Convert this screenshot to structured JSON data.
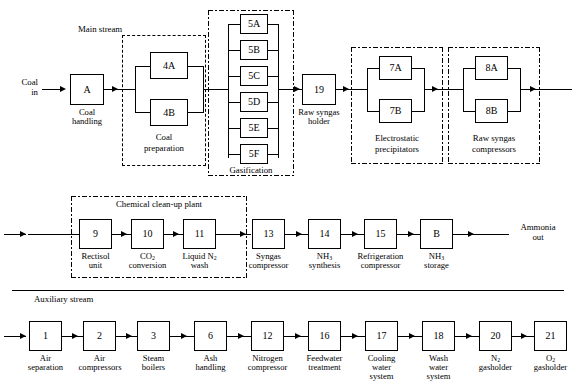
{
  "diagram": {
    "type": "process-flow-diagram",
    "stream_labels": {
      "main_stream": "Main stream",
      "auxiliary_stream": "Auxiliary stream"
    },
    "terminals": {
      "coal_in": "Coal\nin",
      "coal_in_line1": "Coal",
      "coal_in_line2": "in",
      "ammonia_out_line1": "Ammonia",
      "ammonia_out_line2": "out"
    },
    "groups": [
      {
        "id": "coal-preparation",
        "label": "Coal\npreparation",
        "label_line1": "Coal",
        "label_line2": "preparation",
        "style": "dashed"
      },
      {
        "id": "gasification",
        "label": "Gasification",
        "label_line1": "Gasification",
        "label_line2": "",
        "style": "dashdot"
      },
      {
        "id": "electrostatic-precipitators",
        "label": "Electrostatic\nprecipitators",
        "label_line1": "Electrostatic",
        "label_line2": "precipitators",
        "style": "dashdot"
      },
      {
        "id": "raw-syngas-compressors",
        "label": "Raw syngas\ncompressors",
        "label_line1": "Raw syngas",
        "label_line2": "compressors",
        "style": "dashdot"
      },
      {
        "id": "chemical-cleanup-plant",
        "label": "Chemical clean-up plant",
        "label_line1": "Chemical clean-up plant",
        "label_line2": "",
        "style": "dashdot"
      }
    ],
    "main_row": {
      "units": [
        {
          "tag": "A",
          "label_line1": "Coal",
          "label_line2": "handling"
        },
        {
          "tag": "4A",
          "label_line1": "",
          "label_line2": ""
        },
        {
          "tag": "4B",
          "label_line1": "",
          "label_line2": ""
        },
        {
          "tag": "5A",
          "label_line1": "",
          "label_line2": ""
        },
        {
          "tag": "5B",
          "label_line1": "",
          "label_line2": ""
        },
        {
          "tag": "5C",
          "label_line1": "",
          "label_line2": ""
        },
        {
          "tag": "5D",
          "label_line1": "",
          "label_line2": ""
        },
        {
          "tag": "5E",
          "label_line1": "",
          "label_line2": ""
        },
        {
          "tag": "5F",
          "label_line1": "",
          "label_line2": ""
        },
        {
          "tag": "19",
          "label_line1": "Raw syngas",
          "label_line2": "holder"
        },
        {
          "tag": "7A",
          "label_line1": "",
          "label_line2": ""
        },
        {
          "tag": "7B",
          "label_line1": "",
          "label_line2": ""
        },
        {
          "tag": "8A",
          "label_line1": "",
          "label_line2": ""
        },
        {
          "tag": "8B",
          "label_line1": "",
          "label_line2": ""
        }
      ]
    },
    "middle_row": {
      "units": [
        {
          "tag": "9",
          "label_line1": "Rectisol",
          "label_line2": "unit"
        },
        {
          "tag": "10",
          "label_line1": "CO2",
          "label_line2": "conversion",
          "sub": "2",
          "base": "CO"
        },
        {
          "tag": "11",
          "label_line1": "Liquid N2",
          "label_line2": "wash",
          "sub": "2",
          "base": "Liquid N"
        },
        {
          "tag": "13",
          "label_line1": "Syngas",
          "label_line2": "compressor"
        },
        {
          "tag": "14",
          "label_line1": "NH3",
          "label_line2": "synthesis",
          "sub": "3",
          "base": "NH"
        },
        {
          "tag": "15",
          "label_line1": "Refrigeration",
          "label_line2": "compressor"
        },
        {
          "tag": "B",
          "label_line1": "NH3",
          "label_line2": "storage",
          "sub": "3",
          "base": "NH"
        }
      ]
    },
    "auxiliary_row": {
      "units": [
        {
          "tag": "1",
          "label_line1": "Air",
          "label_line2": "separation",
          "label_line3": ""
        },
        {
          "tag": "2",
          "label_line1": "Air",
          "label_line2": "compressors",
          "label_line3": ""
        },
        {
          "tag": "3",
          "label_line1": "Steam",
          "label_line2": "boilers",
          "label_line3": ""
        },
        {
          "tag": "6",
          "label_line1": "Ash",
          "label_line2": "handling",
          "label_line3": ""
        },
        {
          "tag": "12",
          "label_line1": "Nitrogen",
          "label_line2": "compressor",
          "label_line3": ""
        },
        {
          "tag": "16",
          "label_line1": "Feedwater",
          "label_line2": "treatment",
          "label_line3": ""
        },
        {
          "tag": "17",
          "label_line1": "Cooling",
          "label_line2": "water",
          "label_line3": "system"
        },
        {
          "tag": "18",
          "label_line1": "Wash",
          "label_line2": "water",
          "label_line3": "system"
        },
        {
          "tag": "20",
          "label_line1": "N2",
          "label_line2": "gasholder",
          "label_line3": "",
          "sub": "2",
          "base": "N"
        },
        {
          "tag": "21",
          "label_line1": "O2",
          "label_line2": "gasholder",
          "label_line3": "",
          "sub": "2",
          "base": "O"
        }
      ]
    },
    "colors": {
      "line": "#000000",
      "background": "#ffffff"
    }
  }
}
